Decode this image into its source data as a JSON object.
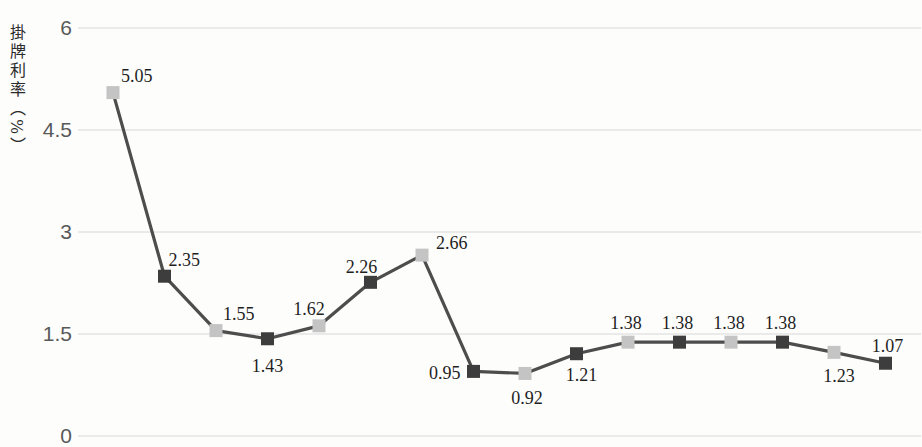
{
  "chart_data": {
    "type": "line",
    "title": "",
    "ylabel": "掛牌利率（%）",
    "xlabel": "",
    "ylim": [
      0,
      6
    ],
    "yticks": [
      "6",
      "4.5",
      "3",
      "1.5",
      "0"
    ],
    "ytick_values": [
      6,
      4.5,
      3,
      1.5,
      0
    ],
    "grid": true,
    "legend": "none",
    "x_axis_labels_visible": false,
    "num_points": 16,
    "values": [
      5.05,
      2.35,
      1.55,
      1.43,
      1.62,
      2.26,
      2.66,
      0.95,
      0.92,
      1.21,
      1.38,
      1.38,
      1.38,
      1.38,
      1.23,
      1.07
    ],
    "point_labels": [
      "5.05",
      "2.35",
      "1.55",
      "1.43",
      "1.62",
      "2.26",
      "2.66",
      "0.95",
      "0.92",
      "1.21",
      "1.38",
      "1.38",
      "1.38",
      "1.38",
      "1.23",
      "1.07"
    ],
    "colors": {
      "line": "#4d4d4d",
      "marker_light": "#c4c4c4",
      "marker_dark": "#3d3d3d",
      "gridline": "#d7d7d7",
      "tick_text": "#595959",
      "label_text": "#1f1f1f",
      "background": "#fdfdfc"
    }
  }
}
